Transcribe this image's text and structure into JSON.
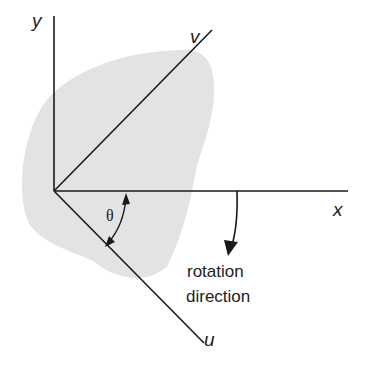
{
  "diagram": {
    "labels": {
      "y_axis": "y",
      "x_axis": "x",
      "v_axis": "v",
      "u_axis": "u",
      "angle": "θ",
      "rotation_line1": "rotation",
      "rotation_line2": "direction"
    },
    "colors": {
      "body_fill": "#e3e3e3",
      "line": "#1a1a1a",
      "background": "#ffffff"
    }
  }
}
